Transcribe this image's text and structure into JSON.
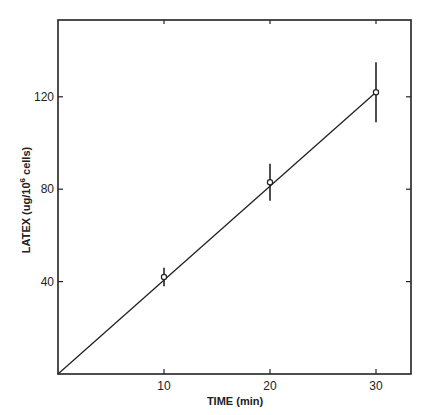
{
  "chart_data": {
    "type": "line",
    "title": "",
    "xlabel": "TIME (min)",
    "ylabel": "LATEX (ug/10^6 cells)",
    "ylabel_main": "LATEX (ug/10",
    "ylabel_sup": "6",
    "ylabel_tail": " cells)",
    "x_ticks": [
      "10",
      "20",
      "30"
    ],
    "y_ticks": [
      "40",
      "80",
      "120"
    ],
    "xlim": [
      0,
      33
    ],
    "ylim": [
      0,
      150
    ],
    "grid": false,
    "legend": null,
    "series": [
      {
        "name": "Latex uptake",
        "x": [
          10,
          20,
          30
        ],
        "y": [
          42,
          83,
          122
        ],
        "error": [
          4,
          8,
          13
        ]
      }
    ],
    "fit_line": {
      "x": [
        0,
        30
      ],
      "y": [
        0,
        122
      ]
    }
  }
}
